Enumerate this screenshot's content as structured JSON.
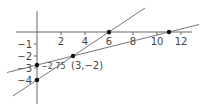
{
  "chart_data": {
    "type": "line",
    "title": "",
    "xlabel": "",
    "ylabel": "",
    "xlim": [
      -2.5,
      13.5
    ],
    "ylim": [
      -5.5,
      2.5
    ],
    "grid": false,
    "x_ticks": [
      {
        "value": 2,
        "label": "2"
      },
      {
        "value": 4,
        "label": "4"
      },
      {
        "value": 6,
        "label": "6"
      },
      {
        "value": 8,
        "label": "8"
      },
      {
        "value": 10,
        "label": "10"
      },
      {
        "value": 12,
        "label": "12"
      }
    ],
    "y_ticks": [
      {
        "value": -1,
        "label": "−1"
      },
      {
        "value": -2,
        "label": "−2"
      },
      {
        "value": -3,
        "label": "−3"
      },
      {
        "value": -4,
        "label": "−4"
      }
    ],
    "series": [
      {
        "name": "line 1",
        "equation": "y = (2/3)x - 4",
        "x": [
          -2,
          9
        ],
        "y": [
          -5.333,
          2
        ]
      },
      {
        "name": "line 2",
        "equation": "y = 0.25x - 2.75",
        "x": [
          -2.5,
          13.5
        ],
        "y": [
          -3.375,
          0.625
        ]
      }
    ],
    "points": [
      {
        "x": 0,
        "y": -4
      },
      {
        "x": 0,
        "y": -2.75
      },
      {
        "x": 3,
        "y": -2
      },
      {
        "x": 6,
        "y": 0
      },
      {
        "x": 11,
        "y": 0
      }
    ],
    "annotations": [
      {
        "text": "−2.75",
        "x": 0,
        "y": -2.75
      },
      {
        "text": "(3,−2)",
        "x": 3,
        "y": -2
      }
    ]
  }
}
